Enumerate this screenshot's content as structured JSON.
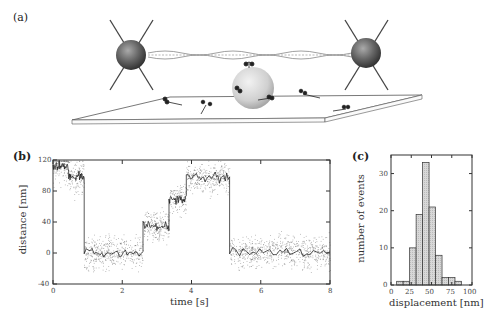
{
  "panels": {
    "a": {
      "label": "(a)"
    },
    "b": {
      "label": "(b)"
    },
    "c": {
      "label": "(c)"
    }
  },
  "chart_data": [
    {
      "panel": "b",
      "type": "scatter",
      "title": "",
      "xlabel": "time [s]",
      "ylabel": "distance [nm]",
      "xlim": [
        0,
        8
      ],
      "ylim": [
        -40,
        120
      ],
      "xticks": [
        "0",
        "2",
        "4",
        "6",
        "8"
      ],
      "yticks": [
        "-40",
        "0",
        "40",
        "80",
        "120"
      ],
      "grid": false,
      "steps": [
        {
          "t_start": 0.0,
          "t_end": 0.45,
          "distance": 112
        },
        {
          "t_start": 0.45,
          "t_end": 0.9,
          "distance": 98
        },
        {
          "t_start": 0.9,
          "t_end": 2.6,
          "distance": 0
        },
        {
          "t_start": 2.6,
          "t_end": 3.35,
          "distance": 35
        },
        {
          "t_start": 3.35,
          "t_end": 3.85,
          "distance": 70
        },
        {
          "t_start": 3.85,
          "t_end": 5.1,
          "distance": 98
        },
        {
          "t_start": 5.1,
          "t_end": 8.0,
          "distance": 2
        }
      ]
    },
    {
      "panel": "c",
      "type": "bar",
      "title": "",
      "xlabel": "displacement [nm]",
      "ylabel": "number of events",
      "xlim": [
        0,
        100
      ],
      "ylim": [
        0,
        35
      ],
      "xticks": [
        "0",
        "25",
        "50",
        "75",
        "100"
      ],
      "yticks": [
        "0",
        "10",
        "20",
        "30"
      ],
      "grid": false,
      "bin_edges": [
        7,
        15,
        23,
        31,
        39,
        47,
        55,
        63,
        71,
        79,
        87
      ],
      "categories": [
        "7-15",
        "15-23",
        "23-31",
        "31-39",
        "39-47",
        "47-55",
        "55-63",
        "63-71",
        "71-79",
        "79-87",
        "87-95"
      ],
      "values": [
        1,
        1,
        10,
        19,
        33,
        21,
        8,
        2,
        2,
        1,
        0
      ]
    }
  ]
}
